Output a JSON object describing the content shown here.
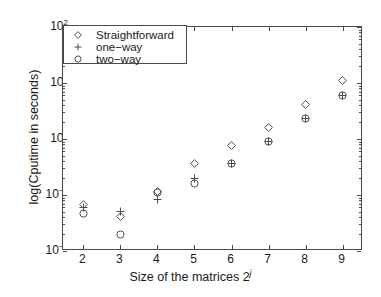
{
  "chart_data": {
    "type": "scatter",
    "title": "",
    "xlabel": "Size of the matrices 2^j",
    "ylabel": "log(Cputime in seconds)",
    "xlim": [
      1.45,
      9.55
    ],
    "ylim": [
      0.01,
      100
    ],
    "yscale": "log",
    "xscale": "linear",
    "grid": false,
    "legend_position": "upper left",
    "x_ticks": [
      "2",
      "3",
      "4",
      "5",
      "6",
      "7",
      "8",
      "9"
    ],
    "x_tick_values": [
      2,
      3,
      4,
      5,
      6,
      7,
      8,
      9
    ],
    "y_ticks": [
      "10^2",
      "10^1",
      "10^0",
      "10^-1",
      "10^-2"
    ],
    "y_tick_values": [
      100,
      10,
      1,
      0.1,
      0.01
    ],
    "x": [
      2,
      3,
      4,
      5,
      6,
      7,
      8,
      9
    ],
    "series": [
      {
        "name": "Straightforward",
        "marker": "diamond",
        "values": [
          0.068,
          0.042,
          0.115,
          0.36,
          0.78,
          1.6,
          4.1,
          11.0
        ]
      },
      {
        "name": "one−way",
        "marker": "plus",
        "values": [
          0.059,
          0.05,
          0.084,
          0.2,
          0.37,
          0.92,
          2.3,
          5.9
        ]
      },
      {
        "name": "two−way",
        "marker": "circle",
        "values": [
          0.046,
          0.02,
          0.11,
          0.16,
          0.37,
          0.92,
          2.3,
          5.9
        ]
      }
    ]
  },
  "axes": {
    "y_tick_labels": [
      {
        "mantissa": "10",
        "exponent": "2"
      },
      {
        "mantissa": "10",
        "exponent": "1"
      },
      {
        "mantissa": "10",
        "exponent": "0"
      },
      {
        "mantissa": "10",
        "exponent": "−1"
      },
      {
        "mantissa": "10",
        "exponent": "−2"
      }
    ],
    "x_tick_labels": [
      "2",
      "3",
      "4",
      "5",
      "6",
      "7",
      "8",
      "9"
    ],
    "x_title_main": "Size of the matrices 2",
    "x_title_sup": "j",
    "y_title": "log(Cputime in seconds)"
  },
  "legend": {
    "entries": [
      {
        "label": "Straightforward",
        "marker": "diamond"
      },
      {
        "label": "one−way",
        "marker": "plus"
      },
      {
        "label": "two−way",
        "marker": "circle"
      }
    ]
  },
  "style": {
    "axis_color": "#4a4a4a",
    "marker_color": "#4f4f4f",
    "text_color": "#1a1a1a",
    "background": "#ffffff"
  }
}
